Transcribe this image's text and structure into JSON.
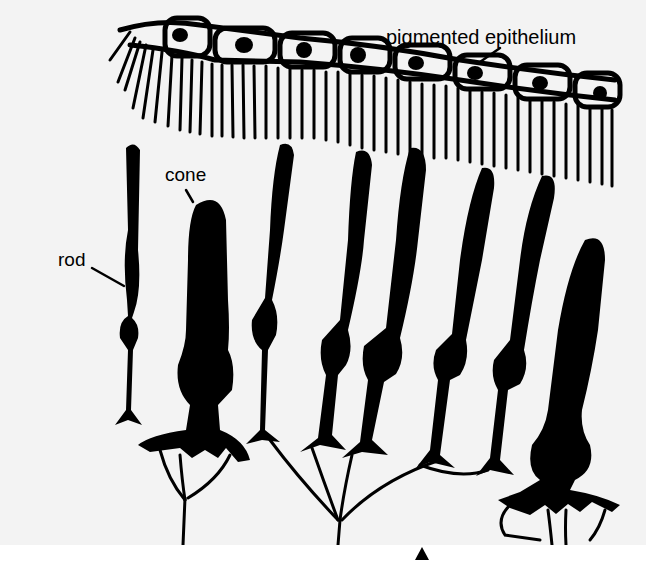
{
  "figure": {
    "labels": {
      "pigmented_epithelium": "pigmented epithelium",
      "cone": "cone",
      "rod": "rod"
    },
    "colors": {
      "ink": "#000000",
      "paper": "#f3f3f3",
      "background": "#ffffff"
    },
    "structures": {
      "epithelium_cells": 8,
      "rods": 7,
      "cones": 2
    },
    "marker": {
      "symbol": "triangle-up",
      "position": "bottom-center"
    }
  }
}
